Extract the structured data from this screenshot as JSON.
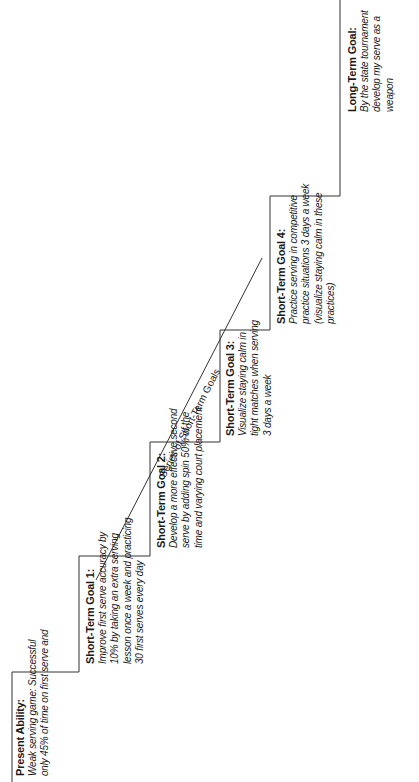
{
  "diagram": {
    "type": "staircase-goal-setting",
    "orientation": "rotated -90deg (text reads bottom-to-top)",
    "diagonal_label": "Series of Short-Term Goals",
    "steps": [
      {
        "title": "Present Ability:",
        "lines": [
          "Weak serving game: Successful",
          "only 45% of time on first serve and"
        ]
      },
      {
        "title": "Short-Term Goal 1:",
        "lines": [
          "Improve first serve accuracy by",
          "10% by taking an extra serving",
          "lesson once a week and practicing",
          "30 first serves every day"
        ]
      },
      {
        "title": "Short-Term Goal 2:",
        "lines": [
          "Develop a more effective second",
          "serve by adding spin 50% of the",
          "time and varying court placement"
        ]
      },
      {
        "title": "Short-Term Goal 3:",
        "lines": [
          "Visualize staying calm in",
          "tight matches when serving",
          "3 days a week"
        ]
      },
      {
        "title": "Short-Term Goal 4:",
        "lines": [
          "Practice serving in competitive",
          "practice situations 3 days a week",
          "(visualize staying calm in these",
          "practices)"
        ]
      },
      {
        "title": "Long-Term Goal:",
        "lines": [
          "By the state tournament",
          "develop my serve as a",
          "weapon"
        ]
      }
    ]
  }
}
